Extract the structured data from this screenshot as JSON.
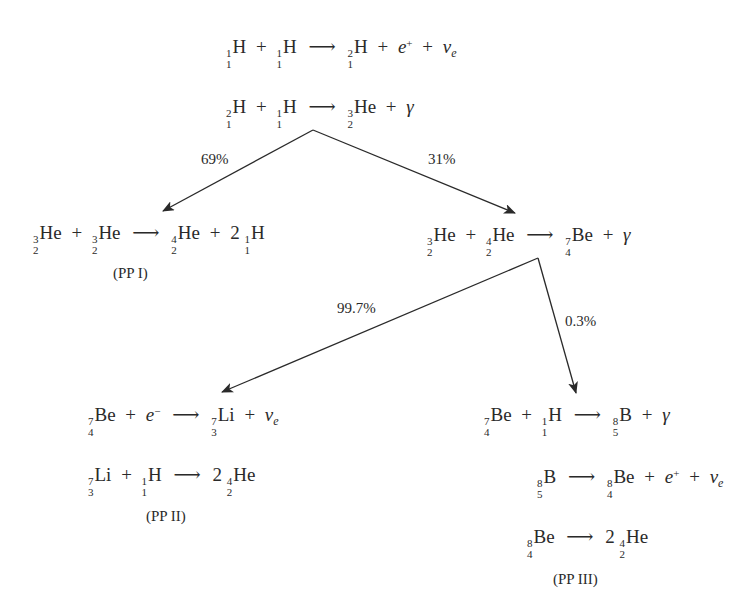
{
  "diagram": {
    "colors": {
      "ink": "#2a2a2a",
      "background": "#ffffff"
    },
    "reactions": {
      "r1": "1 1 H + 1 1 H → 2 1 H + e+ + ν_e",
      "r2": "2 1 H + 1 1 H → 3 2 He + γ",
      "pp1": "3 2 He + 3 2 He → 4 2 He + 2 1 1 H",
      "branch2": "3 2 He + 4 2 He → 7 4 Be + γ",
      "pp2a": "7 4 Be + e− → 7 3 Li + ν_e",
      "pp2b": "7 3 Li + 1 1 H → 2 4 2 He",
      "pp3a": "7 4 Be + 1 1 H → 8 5 B + γ",
      "pp3b": "8 5 B → 8 4 Be + e+ + ν_e",
      "pp3c": "8 4 Be → 2 4 2 He"
    },
    "symbols": {
      "H": "H",
      "He": "He",
      "Be": "Be",
      "Li": "Li",
      "B": "B",
      "plus": "+",
      "arrow": "⟶",
      "gamma": "γ",
      "e": "e",
      "nu": "ν",
      "e_sub": "e",
      "positive": "+",
      "negative": "−",
      "two": "2",
      "n0": "0",
      "n1": "1",
      "n2": "2",
      "n3": "3",
      "n4": "4",
      "n5": "5",
      "n7": "7",
      "n8": "8"
    },
    "branches": {
      "pp1_pct": "69%",
      "pp23_pct": "31%",
      "pp2_pct": "99.7%",
      "pp3_pct": "0.3%"
    },
    "chain_labels": {
      "pp1": "(PP I)",
      "pp2": "(PP II)",
      "pp3": "(PP III)"
    }
  }
}
